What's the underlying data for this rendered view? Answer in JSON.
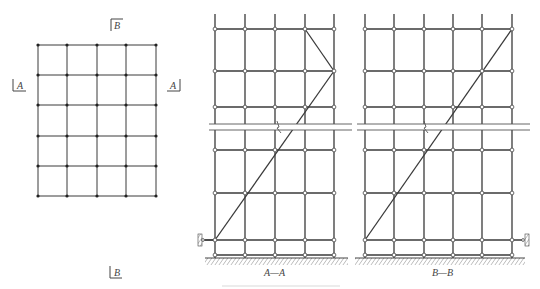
{
  "plan": {
    "columns_x": [
      38,
      67,
      97,
      126,
      156
    ],
    "rows_y": [
      45,
      75,
      105,
      136,
      166,
      196
    ],
    "section_markers": [
      {
        "label": "B",
        "position": "top"
      },
      {
        "label": "B",
        "position": "bottom"
      },
      {
        "label": "A",
        "position": "left"
      },
      {
        "label": "A",
        "position": "right"
      }
    ]
  },
  "sections": [
    {
      "title": "A—A",
      "columns_x": [
        215,
        245,
        275,
        305,
        334
      ],
      "diagonal": "zigzag from top-right down-left to wall tie",
      "wall_tie_side": "left"
    },
    {
      "title": "B—B",
      "columns_x": [
        365,
        394,
        424,
        453,
        482,
        512
      ],
      "diagonal": "single diagonal from top-right to bottom-left",
      "wall_tie_side": "right"
    }
  ],
  "labels": {
    "plan_top_marker": "B",
    "plan_bottom_marker": "B",
    "plan_left_marker": "A",
    "plan_right_marker": "A",
    "section_a_title": "A—A",
    "section_b_title": "B—B"
  },
  "colors": {
    "line": "#3a3a3a",
    "node_fill": "#ffffff",
    "dot": "#222222"
  }
}
